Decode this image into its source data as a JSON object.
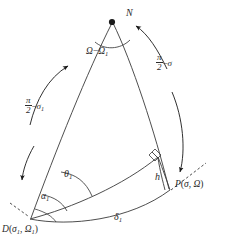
{
  "figure": {
    "type": "spherical-triangle-diagram",
    "title": "",
    "stroke_color": "#3a3a3a",
    "text_color": "#2b2b2b",
    "background": "#ffffff",
    "width": 226,
    "height": 245
  },
  "vertices": {
    "north_pole": {
      "name": "N",
      "label": "N",
      "x": 112,
      "y": 22,
      "marker": "filled-dot"
    },
    "point_D": {
      "name": "D",
      "label_main": "D",
      "label_args": "(",
      "arg1": "σ",
      "arg1_sub": "1",
      "sep": ", ",
      "arg2": "Ω",
      "arg2_sub": "1",
      "close": ")",
      "x": 30,
      "y": 219
    },
    "point_P": {
      "name": "P",
      "label_main": "P",
      "arg1": "σ",
      "arg2": "Ω",
      "x": 172,
      "y": 189
    }
  },
  "labels": {
    "north_pole": "N",
    "apex_angle": {
      "omega": "Ω",
      "minus": "−",
      "omega1": "Ω",
      "omega1_sub": "1"
    },
    "right_side": {
      "pi": "π",
      "two": "2",
      "minus": "−",
      "sigma": "σ"
    },
    "left_side": {
      "pi": "π",
      "two": "2",
      "minus": "−",
      "sigma": "σ",
      "sigma_sub": "1"
    },
    "theta1": {
      "sym": "θ",
      "sub": "1"
    },
    "alpha1": {
      "sym": "α",
      "sub": "1"
    },
    "altitude_h": "h",
    "delta1": {
      "sym": "δ",
      "sub": "1"
    },
    "point_P_label": {
      "p": "P",
      "open": "(",
      "sigma": "σ",
      "comma": ", ",
      "omega": "Ω",
      "close": ")"
    },
    "point_D_label": {
      "d": "D",
      "open": "(",
      "sigma": "σ",
      "sigma_sub": "1",
      "comma": ", ",
      "omega": "Ω",
      "omega_sub": "1",
      "close": ")"
    }
  },
  "annotations": {
    "right_angle_marker": "right-angle-square",
    "arrows": [
      {
        "name": "left-upper-arrow",
        "direction": "up-right"
      },
      {
        "name": "left-lower-arrow",
        "direction": "down"
      },
      {
        "name": "right-upper-arrow",
        "direction": "up-left"
      },
      {
        "name": "right-lower-arrow",
        "direction": "down"
      }
    ],
    "dashed_lines": [
      {
        "name": "dashed-tangent-at-D"
      },
      {
        "name": "dashed-tangent-at-P"
      }
    ]
  }
}
